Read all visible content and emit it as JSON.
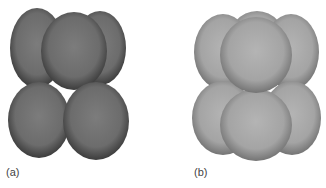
{
  "figure": {
    "panels": [
      {
        "id": "a",
        "label": "(a)",
        "description": "Body-centered arrangement of slightly ellipsoidal dark gray spheres",
        "sphere_color": "#6e6e6e",
        "sphere_edge": "#3f3f3f"
      },
      {
        "id": "b",
        "label": "(b)",
        "description": "Close-packed arrangement of light gray spheres",
        "sphere_color": "#a8a8a8",
        "sphere_edge": "#6a6a6a"
      }
    ]
  }
}
